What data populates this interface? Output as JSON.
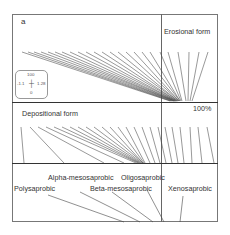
{
  "panel_label": "a",
  "labels": {
    "erosional": "Erosional form",
    "depositional": "Depositional form",
    "percent": "100%",
    "polysaprobic": "Polysaprobic",
    "alpha": "Alpha-mesosaprobic",
    "beta": "Beta-mesosaprobic",
    "oligo": "Oligosaprobic",
    "xeno": "Xenosaprobic"
  },
  "legend": {
    "top": "100",
    "left": "-1.1",
    "right": "1.28",
    "bottom": "0"
  },
  "colors": {
    "frame": "#555555",
    "line": "#444444",
    "text": "#333333"
  }
}
